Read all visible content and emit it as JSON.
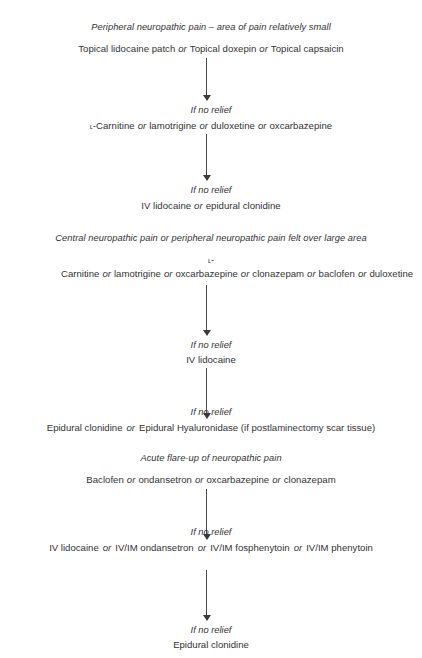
{
  "document": {
    "title": "Neuropathic pain treatment algorithm"
  },
  "sections": [
    {
      "id": "peripheral-small-area",
      "heading": "Peripheral neuropathic pain – area of pain relatively small",
      "tier1": {
        "items": [
          "Topical lidocaine patch",
          "Topical doxepin",
          "Topical capsaicin"
        ],
        "separator": "or"
      },
      "step1_label": "If no relief",
      "tier2": {
        "items": [
          "ʟ-Carnitine",
          "lamotrigine",
          "duloxetine",
          "oxcarbazepine"
        ],
        "separator": "or"
      },
      "step2_label": "If no relief",
      "tier3": {
        "items": [
          "IV lidocaine",
          "epidural clonidine"
        ],
        "separator": "or"
      }
    },
    {
      "id": "central-or-large-area",
      "heading": "Central neuropathic pain or peripheral neuropathic pain felt over large area",
      "tier1": {
        "items": [
          "ʟ-Carnitine",
          "lamotrigine",
          "oxcarbazepine",
          "clonazepam",
          "baclofen",
          "duloxetine"
        ],
        "separator": "or"
      },
      "step1_label": "If no relief",
      "tier2": {
        "items": [
          "IV lidocaine"
        ],
        "separator": "or"
      },
      "step2_label": "If no relief",
      "tier3": {
        "items": [
          "Epidural clonidine",
          "Epidural Hyaluronidase (if postlaminectomy scar tissue)"
        ],
        "separator": "or"
      }
    },
    {
      "id": "acute-flare-up",
      "heading": "Acute flare-up of neuropathic pain",
      "tier1": {
        "items": [
          "Baclofen",
          "ondansetron",
          "oxcarbazepine",
          "clonazepam"
        ],
        "separator": "or"
      },
      "step1_label": "If no relief",
      "tier2": {
        "items": [
          "IV lidocaine",
          "IV/IM ondansetron",
          "IV/IM fosphenytoin",
          "IV/IM phenytoin"
        ],
        "separator": "or"
      },
      "step2_label": "If no relief",
      "tier3": {
        "items": [
          "Epidural clonidine"
        ],
        "separator": "or"
      }
    }
  ],
  "labels": {
    "or": "or",
    "if_no_relief": "If no relief"
  },
  "text": {
    "s1_heading": "Peripheral neuropathic pain – area of pain relatively small",
    "s1_t1_a": "Topical lidocaine patch",
    "s1_t1_b": "Topical doxepin",
    "s1_t1_c": "Topical capsaicin",
    "s1_relief1": "If no relief",
    "s1_t2_a": "-Carnitine",
    "s1_t2_b": "lamotrigine",
    "s1_t2_c": "duloxetine",
    "s1_t2_d": "oxcarbazepine",
    "s1_relief2": "If no relief",
    "s1_t3_a": "IV lidocaine",
    "s1_t3_b": "epidural clonidine",
    "s2_heading": "Central neuropathic pain or peripheral neuropathic pain felt over large area",
    "s2_t1_a": "-Carnitine",
    "s2_t1_b": "lamotrigine",
    "s2_t1_c": "oxcarbazepine",
    "s2_t1_d": "clonazepam",
    "s2_t1_e": "baclofen",
    "s2_t1_f": "duloxetine",
    "s2_relief1": "If no relief",
    "s2_t2_a": "IV lidocaine",
    "s2_relief2": "If no relief",
    "s2_t3_a": "Epidural clonidine",
    "s2_t3_b": "Epidural Hyaluronidase (if postlaminectomy scar tissue)",
    "s3_heading": "Acute flare-up of neuropathic pain",
    "s3_t1_a": "Baclofen",
    "s3_t1_b": "ondansetron",
    "s3_t1_c": "oxcarbazepine",
    "s3_t1_d": "clonazepam",
    "s3_relief1": "If no relief",
    "s3_t2_a": "IV lidocaine",
    "s3_t2_b": "IV/IM ondansetron",
    "s3_t2_c": "IV/IM fosphenytoin",
    "s3_t2_d": "IV/IM phenytoin",
    "s3_relief2": "If no relief",
    "s3_t3_a": "Epidural clonidine",
    "smallcap_L": "ʟ"
  },
  "colors": {
    "text": "#333333",
    "arrow": "#4a4a4a",
    "background": "#ffffff"
  }
}
